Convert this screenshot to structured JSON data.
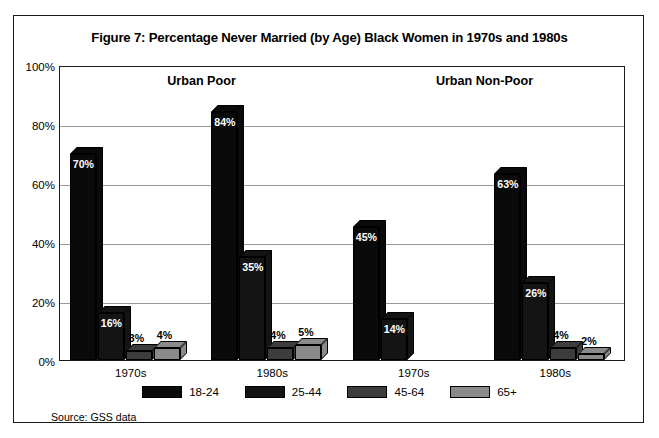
{
  "figure": {
    "title": "Figure 7: Percentage Never Married (by Age) Black Women in 1970s and 1980s",
    "source": "Source:  GSS data"
  },
  "chart_data": {
    "type": "bar",
    "title": "Figure 7: Percentage Never Married (by Age) Black Women in 1970s and 1980s",
    "xlabel": "",
    "ylabel": "",
    "ylim": [
      0,
      100
    ],
    "ytick_labels": [
      "0%",
      "20%",
      "40%",
      "60%",
      "80%",
      "100%"
    ],
    "ytick_values": [
      0,
      20,
      40,
      60,
      80,
      100
    ],
    "grid": true,
    "legend_position": "bottom",
    "categories": [
      "1970s",
      "1980s",
      "1970s",
      "1980s"
    ],
    "group_headers": [
      "Urban Poor",
      "Urban Non-Poor"
    ],
    "series": [
      {
        "name": "18-24",
        "color": "#0a0a0a",
        "values": [
          70,
          84,
          45,
          63
        ],
        "labels": [
          "70%",
          "84%",
          "45%",
          "63%"
        ]
      },
      {
        "name": "25-44",
        "color": "#141414",
        "values": [
          16,
          35,
          14,
          26
        ],
        "labels": [
          "16%",
          "35%",
          "14%",
          "26%"
        ]
      },
      {
        "name": "45-64",
        "color": "#3d3d3d",
        "values": [
          3,
          4,
          null,
          4
        ],
        "labels": [
          "3%",
          "4%",
          "",
          "4%"
        ]
      },
      {
        "name": "65+",
        "color": "#8a8a8a",
        "values": [
          4,
          5,
          null,
          2
        ],
        "labels": [
          "4%",
          "5%",
          "",
          "2%"
        ]
      }
    ],
    "annotations": [
      "Source:  GSS data"
    ]
  }
}
